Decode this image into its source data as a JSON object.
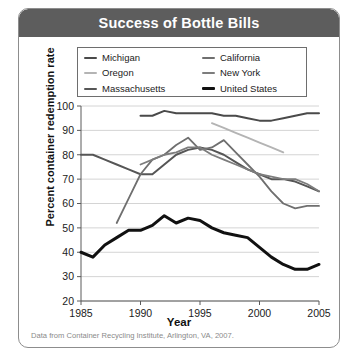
{
  "figure": {
    "title": "Success of Bottle Bills",
    "caption": "Data from Container Recycling Institute, Arlington, VA, 2007.",
    "title_bar_color": "#5d5d5d"
  },
  "legend": {
    "entries": [
      {
        "label": "Michigan",
        "color": "#4a4a4a",
        "width": 2.0
      },
      {
        "label": "California",
        "color": "#6f6f6f",
        "width": 1.8
      },
      {
        "label": "Oregon",
        "color": "#b4b4b4",
        "width": 1.8
      },
      {
        "label": "New York",
        "color": "#7d7d7d",
        "width": 1.8
      },
      {
        "label": "Massachusetts",
        "color": "#565656",
        "width": 2.0
      },
      {
        "label": "United States",
        "color": "#111111",
        "width": 3.0
      }
    ]
  },
  "chart_data": {
    "type": "line",
    "title": "Success of Bottle Bills",
    "xlabel": "Year",
    "ylabel": "Percent container redemption rate",
    "xlim": [
      1985,
      2005
    ],
    "ylim": [
      20,
      100
    ],
    "xticks": [
      1985,
      1990,
      1995,
      2000,
      2005
    ],
    "yticks": [
      20,
      30,
      40,
      50,
      60,
      70,
      80,
      90,
      100
    ],
    "grid": "horizontal",
    "legend_position": "top-inside",
    "series": [
      {
        "name": "Michigan",
        "color": "#4a4a4a",
        "width": 2.0,
        "x": [
          1990,
          1991,
          1992,
          1993,
          1994,
          1995,
          1996,
          1997,
          1998,
          1999,
          2000,
          2001,
          2002,
          2003,
          2004,
          2005
        ],
        "values": [
          96,
          96,
          98,
          97,
          97,
          97,
          97,
          96,
          96,
          95,
          94,
          94,
          95,
          96,
          97,
          97
        ]
      },
      {
        "name": "Oregon",
        "color": "#b4b4b4",
        "width": 1.8,
        "x": [
          1996,
          1997,
          1998,
          1999,
          2000,
          2001,
          2002
        ],
        "values": [
          93,
          91,
          89,
          87,
          85,
          83,
          81
        ]
      },
      {
        "name": "Massachusetts",
        "color": "#565656",
        "width": 2.0,
        "x": [
          1985,
          1986,
          1987,
          1988,
          1989,
          1990,
          1991,
          1992,
          1993,
          1994,
          1995,
          1996,
          1997,
          1998,
          1999,
          2000,
          2001,
          2002,
          2003,
          2004,
          2005
        ],
        "values": [
          80,
          80,
          78,
          76,
          74,
          72,
          72,
          76,
          80,
          82,
          83,
          82,
          80,
          77,
          74,
          72,
          70,
          70,
          69,
          67,
          65
        ]
      },
      {
        "name": "California",
        "color": "#6f6f6f",
        "width": 1.8,
        "x": [
          1988,
          1989,
          1990,
          1991,
          1992,
          1993,
          1994,
          1995,
          1996,
          1997,
          1998,
          1999,
          2000,
          2001,
          2002,
          2003,
          2004,
          2005
        ],
        "values": [
          52,
          62,
          72,
          78,
          80,
          84,
          87,
          82,
          83,
          86,
          81,
          76,
          71,
          65,
          60,
          58,
          59,
          59
        ]
      },
      {
        "name": "New York",
        "color": "#7d7d7d",
        "width": 1.8,
        "x": [
          1990,
          1991,
          1992,
          1993,
          1994,
          1995,
          1996,
          1997,
          1998,
          1999,
          2000,
          2001,
          2002,
          2003,
          2004,
          2005
        ],
        "values": [
          76,
          78,
          80,
          81,
          83,
          83,
          80,
          78,
          76,
          74,
          72,
          71,
          70,
          70,
          68,
          65
        ]
      },
      {
        "name": "United States",
        "color": "#111111",
        "width": 3.0,
        "x": [
          1985,
          1986,
          1987,
          1988,
          1989,
          1990,
          1991,
          1992,
          1993,
          1994,
          1995,
          1996,
          1997,
          1998,
          1999,
          2000,
          2001,
          2002,
          2003,
          2004,
          2005
        ],
        "values": [
          40,
          38,
          43,
          46,
          49,
          49,
          51,
          55,
          52,
          54,
          53,
          50,
          48,
          47,
          46,
          42,
          38,
          35,
          33,
          33,
          35
        ]
      }
    ]
  }
}
